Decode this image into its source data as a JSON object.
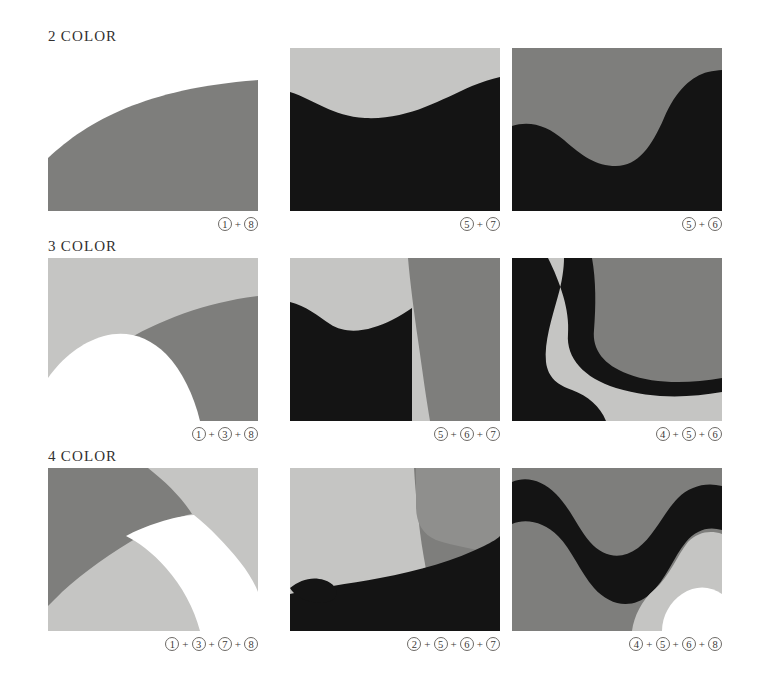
{
  "page": {
    "background": "#ffffff",
    "width": 766,
    "height": 680,
    "palette": {
      "white": "#ffffff",
      "light_gray": "#c5c5c3",
      "medium_gray": "#7e7e7c",
      "black": "#141414",
      "caption_text": "#33312f",
      "heading_text": "#32302f",
      "circle_stroke": "#6d6a66"
    }
  },
  "sections": [
    {
      "id": "two-color",
      "heading_number": "2",
      "heading_word": "COLOR",
      "heading": "2 COLOR",
      "panels": [
        {
          "id": "panel-1-1",
          "caption_parts": [
            "1",
            "8"
          ],
          "colors_used": [
            "#7e7e7c",
            "#ffffff"
          ],
          "description": "white field with gray quarter-arc rising from lower left to upper right"
        },
        {
          "id": "panel-1-2",
          "caption_parts": [
            "5",
            "7"
          ],
          "colors_used": [
            "#c5c5c3",
            "#141414"
          ],
          "description": "light gray sky over black wave that dips in the center and rises at right"
        },
        {
          "id": "panel-1-3",
          "caption_parts": [
            "5",
            "6"
          ],
          "colors_used": [
            "#7e7e7c",
            "#141414"
          ],
          "description": "medium gray field with black S-curve wave forming a valley in the center"
        }
      ]
    },
    {
      "id": "three-color",
      "heading_number": "3",
      "heading_word": "COLOR",
      "heading": "3 COLOR",
      "panels": [
        {
          "id": "panel-2-1",
          "caption_parts": [
            "1",
            "3",
            "8"
          ],
          "colors_used": [
            "#c5c5c3",
            "#7e7e7c",
            "#ffffff"
          ],
          "description": "light gray upper field, medium gray diagonal band, white arc at lower left"
        },
        {
          "id": "panel-2-2",
          "caption_parts": [
            "5",
            "6",
            "7"
          ],
          "colors_used": [
            "#c5c5c3",
            "#7e7e7c",
            "#141414"
          ],
          "description": "light gray upper left, black lower left mass, medium gray vertical band at right"
        },
        {
          "id": "panel-2-3",
          "caption_parts": [
            "4",
            "5",
            "6"
          ],
          "colors_used": [
            "#141414",
            "#c5c5c3",
            "#7e7e7c"
          ],
          "description": "black left region, light gray S-band, medium gray right region"
        }
      ]
    },
    {
      "id": "four-color",
      "heading_number": "4",
      "heading_word": "COLOR",
      "heading": "4 COLOR",
      "panels": [
        {
          "id": "panel-3-1",
          "caption_parts": [
            "1",
            "3",
            "7",
            "8"
          ],
          "colors_used": [
            "#7e7e7c",
            "#c5c5c3",
            "#ffffff",
            "#a8a8a6"
          ],
          "description": "medium gray wedge upper left, light gray lower left, white arc band sweeping right"
        },
        {
          "id": "panel-3-2",
          "caption_parts": [
            "2",
            "5",
            "6",
            "7"
          ],
          "colors_used": [
            "#c5c5c3",
            "#7e7e7c",
            "#141414",
            "#8f8f8d"
          ],
          "description": "light gray upper left, medium gray right band, black lower wave"
        },
        {
          "id": "panel-3-3",
          "caption_parts": [
            "4",
            "5",
            "6",
            "8"
          ],
          "colors_used": [
            "#7e7e7c",
            "#141414",
            "#c5c5c3",
            "#ffffff"
          ],
          "description": "medium gray top, black wave through center, white lower right lobe"
        }
      ]
    }
  ],
  "caption_separator": "+"
}
